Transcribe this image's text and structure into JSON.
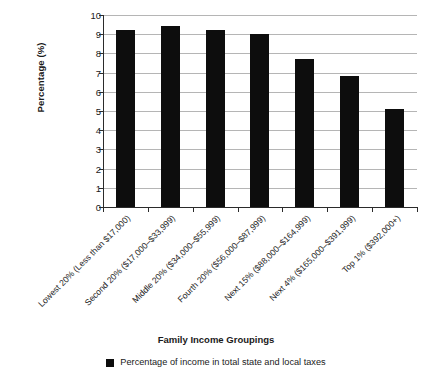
{
  "chart_data": {
    "type": "bar",
    "title": "",
    "xlabel": "Family Income Groupings",
    "ylabel": "Percentage (%)",
    "ylim": [
      0,
      10
    ],
    "ytick_labels": [
      "10",
      "9",
      "8",
      "7",
      "6",
      "5",
      "4",
      "3",
      "2",
      "1",
      "0"
    ],
    "ytick_values": [
      10,
      9,
      8,
      7,
      6,
      5,
      4,
      3,
      2,
      1,
      0
    ],
    "grid": true,
    "legend_position": "bottom",
    "bar_color": "#0d0d0d",
    "categories": [
      "Lowest 20% (Less than $17,000)",
      "Second 20% ($17,000–$33,999)",
      "Middle 20% ($34,000–$55,999)",
      "Fourth 20% ($56,000–$87,999)",
      "Next 15% ($88,000–$164,999)",
      "Next 4% ($165,000–$391,999)",
      "Top 1% ($392,000+)"
    ],
    "series": [
      {
        "name": "Percentage of income in total state and local taxes",
        "values": [
          9.2,
          9.45,
          9.2,
          9.0,
          7.7,
          6.8,
          5.1
        ]
      }
    ]
  },
  "legend": {
    "entries": [
      {
        "label": "Percentage of income in total state and local taxes",
        "color": "#0d0d0d"
      }
    ]
  }
}
